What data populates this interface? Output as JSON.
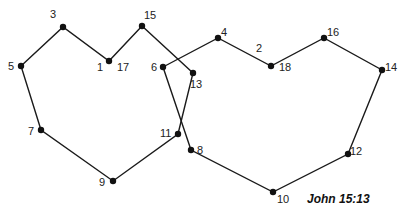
{
  "caption": "John 15:13",
  "colors": {
    "line": "#1a1a1a",
    "dot": "#111111",
    "text": "#222222",
    "background": "#ffffff"
  },
  "points": [
    {
      "n": "1",
      "x": 109,
      "y": 61,
      "lx": 97,
      "ly": 71
    },
    {
      "n": "2",
      "x": null,
      "y": null,
      "lx": 256,
      "ly": 52
    },
    {
      "n": "3",
      "x": 63,
      "y": 27,
      "lx": 50,
      "ly": 18
    },
    {
      "n": "4",
      "x": 218,
      "y": 38,
      "lx": 221,
      "ly": 36
    },
    {
      "n": "5",
      "x": 21,
      "y": 66,
      "lx": 8,
      "ly": 70
    },
    {
      "n": "6",
      "x": 163,
      "y": 67,
      "lx": 151,
      "ly": 71
    },
    {
      "n": "7",
      "x": 41,
      "y": 130,
      "lx": 28,
      "ly": 135
    },
    {
      "n": "8",
      "x": 191,
      "y": 150,
      "lx": 197,
      "ly": 154
    },
    {
      "n": "9",
      "x": 113,
      "y": 181,
      "lx": 99,
      "ly": 186
    },
    {
      "n": "10",
      "x": 273,
      "y": 192,
      "lx": 277,
      "ly": 203
    },
    {
      "n": "11",
      "x": 178,
      "y": 134,
      "lx": 160,
      "ly": 137
    },
    {
      "n": "12",
      "x": 348,
      "y": 154,
      "lx": 350,
      "ly": 155
    },
    {
      "n": "13",
      "x": 193,
      "y": 73,
      "lx": 190,
      "ly": 88
    },
    {
      "n": "14",
      "x": 382,
      "y": 70,
      "lx": 385,
      "ly": 71
    },
    {
      "n": "15",
      "x": 142,
      "y": 26,
      "lx": 144,
      "ly": 19
    },
    {
      "n": "16",
      "x": 324,
      "y": 38,
      "lx": 327,
      "ly": 36
    },
    {
      "n": "17",
      "x": null,
      "y": null,
      "lx": 117,
      "ly": 71
    },
    {
      "n": "18",
      "x": 271,
      "y": 66,
      "lx": 279,
      "ly": 71
    }
  ],
  "shapes": {
    "left": [
      [
        21,
        66
      ],
      [
        63,
        27
      ],
      [
        109,
        61
      ],
      [
        142,
        26
      ],
      [
        193,
        73
      ],
      [
        178,
        134
      ],
      [
        113,
        181
      ],
      [
        41,
        130
      ]
    ],
    "right": [
      [
        163,
        67
      ],
      [
        218,
        38
      ],
      [
        271,
        66
      ],
      [
        324,
        38
      ],
      [
        382,
        70
      ],
      [
        348,
        154
      ],
      [
        273,
        192
      ],
      [
        191,
        150
      ]
    ]
  }
}
